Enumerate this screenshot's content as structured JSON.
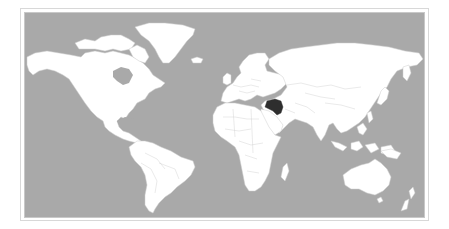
{
  "map": {
    "type": "world-choropleth",
    "projection": "miller-like cylindrical",
    "highlighted_country": "Iraq",
    "colors": {
      "ocean": "#a9a9a9",
      "land": "#ffffff",
      "borders": "#c9c9c9",
      "highlight": "#2e2e2e",
      "frame": "#d0d0d0"
    },
    "regions": [
      {
        "name": "North America"
      },
      {
        "name": "Greenland"
      },
      {
        "name": "South America"
      },
      {
        "name": "Europe"
      },
      {
        "name": "Africa"
      },
      {
        "name": "Asia"
      },
      {
        "name": "Australia"
      },
      {
        "name": "New Zealand"
      }
    ]
  }
}
